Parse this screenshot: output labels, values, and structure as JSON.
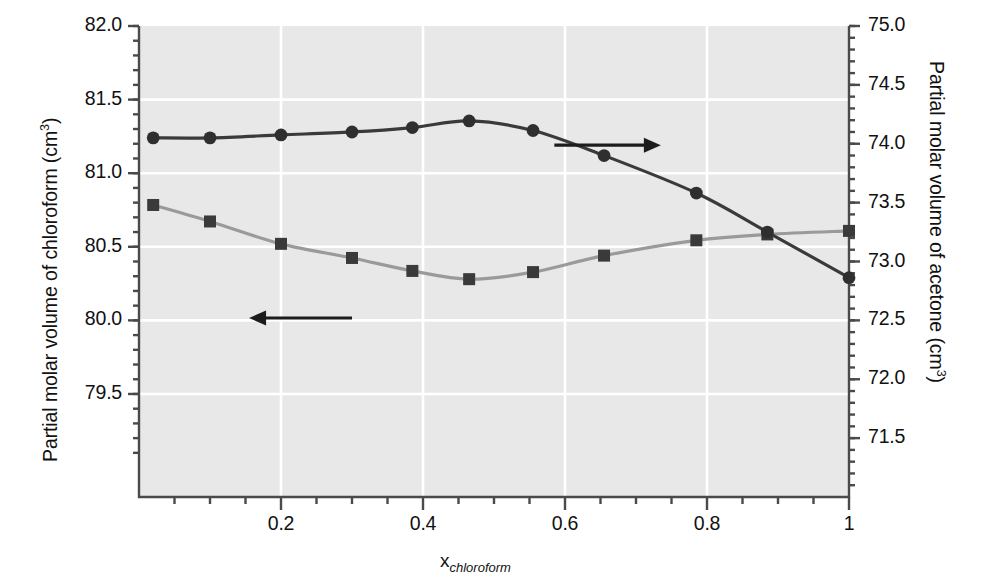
{
  "chart_data": {
    "type": "line",
    "title": "",
    "xlabel": "x_chloroform",
    "xlabel_base": "x",
    "xlabel_sub": "chloroform",
    "ylabel_left": "Partial molar volume of chloroform (cm3)",
    "ylabel_left_main": "Partial molar volume of chloroform (cm",
    "ylabel_left_sup": "3",
    "ylabel_left_tail": ")",
    "ylabel_right": "Partial molar volume of acetone (cm3)",
    "ylabel_right_main": "Partial molar volume of acetone (cm",
    "ylabel_right_sup": "3",
    "ylabel_right_tail": ")",
    "grid": true,
    "legend": "none",
    "xlim": [
      0,
      1
    ],
    "xticks": [
      0.2,
      0.4,
      0.6,
      0.8,
      1
    ],
    "xticklabels": [
      "0.2",
      "0.4",
      "0.6",
      "0.8",
      "1"
    ],
    "ylim_left": [
      78.8,
      82.0
    ],
    "yticks_left": [
      82.0,
      81.5,
      81.0,
      80.5,
      80.0,
      79.5
    ],
    "yticklabels_left": [
      "82.0",
      "81.5",
      "81.0",
      "80.5",
      "80.0",
      "79.5"
    ],
    "ylim_right": [
      71.0,
      75.0
    ],
    "yticks_right": [
      75.0,
      74.5,
      74.0,
      73.5,
      73.0,
      72.5,
      72.0,
      71.5
    ],
    "yticklabels_right": [
      "75.0",
      "74.5",
      "74.0",
      "73.5",
      "73.0",
      "72.5",
      "72.0",
      "71.5"
    ],
    "series": [
      {
        "name": "Partial molar volume of chloroform",
        "axis": "left",
        "marker": "circle",
        "color": "#3a3a3a",
        "x": [
          0.02,
          0.1,
          0.2,
          0.3,
          0.385,
          0.465,
          0.555,
          0.655,
          0.785,
          0.885,
          1.0
        ],
        "values": [
          81.24,
          81.24,
          81.26,
          81.28,
          81.31,
          81.355,
          81.29,
          81.12,
          80.865,
          80.6,
          80.29
        ]
      },
      {
        "name": "Partial molar volume of acetone",
        "axis": "right",
        "marker": "square",
        "color": "#9a9a9a",
        "x": [
          0.02,
          0.1,
          0.2,
          0.3,
          0.385,
          0.465,
          0.555,
          0.655,
          0.785,
          0.885,
          1.0
        ],
        "values": [
          73.48,
          73.34,
          73.15,
          73.03,
          72.92,
          72.85,
          72.91,
          73.05,
          73.18,
          73.23,
          73.26
        ]
      }
    ],
    "annotations": [
      {
        "name": "left-axis-arrow",
        "text": "",
        "direction": "left",
        "x_from": 0.3,
        "x_to": 0.155,
        "y_axis": "right",
        "y": 72.52
      },
      {
        "name": "right-axis-arrow",
        "text": "",
        "direction": "right",
        "x_from": 0.585,
        "x_to": 0.735,
        "y_axis": "left",
        "y": 81.19
      }
    ]
  },
  "colors": {
    "plot_background": "#e8e8e8",
    "gridline": "#ffffff",
    "axis": "#4a4a4a",
    "series_chloroform": "#3a3a3a",
    "series_acetone": "#9a9a9a",
    "page_background": "#ffffff"
  }
}
